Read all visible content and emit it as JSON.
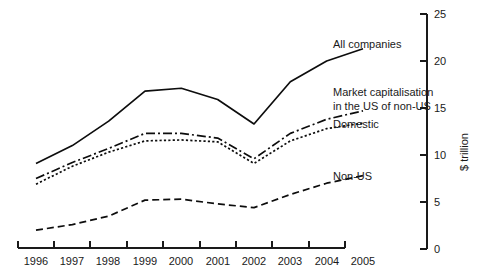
{
  "chart_data": {
    "type": "line",
    "title": "",
    "xlabel": "",
    "ylabel": "$ trillion",
    "ylim": [
      0,
      25
    ],
    "yticks": [
      0,
      5,
      10,
      15,
      20,
      25
    ],
    "grid": false,
    "legend_position": "right-inline-labels",
    "categories": [
      "1996",
      "1997",
      "1998",
      "1999",
      "2000",
      "2001",
      "2002",
      "2003",
      "2004",
      "2005"
    ],
    "x": [
      1996,
      1997,
      1998,
      1999,
      2000,
      2001,
      2002,
      2003,
      2004,
      2005
    ],
    "series": [
      {
        "name": "All companies",
        "style": "solid",
        "values": [
          9.1,
          11.0,
          13.6,
          16.8,
          17.1,
          15.9,
          13.3,
          17.8,
          20.0,
          21.3
        ]
      },
      {
        "name": "Market capitalisation in the US of non-US",
        "label_line1": "Market capitalisation",
        "label_line2": "in the US of non-US",
        "style": "dash-dot",
        "values": [
          7.5,
          9.2,
          10.7,
          12.3,
          12.3,
          11.8,
          9.6,
          12.3,
          13.8,
          14.7
        ]
      },
      {
        "name": "Domestic",
        "style": "dotted",
        "values": [
          6.9,
          8.8,
          10.3,
          11.5,
          11.6,
          11.4,
          9.1,
          11.5,
          12.8,
          13.4
        ]
      },
      {
        "name": "Non-US",
        "style": "dashed",
        "values": [
          2.0,
          2.6,
          3.5,
          5.2,
          5.3,
          4.8,
          4.4,
          5.8,
          7.0,
          7.8
        ]
      }
    ]
  },
  "axes": {
    "y_tick_labels": [
      "25",
      "20",
      "15",
      "10",
      "5",
      "0"
    ],
    "y_axis_title": "$ trillion",
    "x_tick_labels": [
      "1996",
      "1997",
      "1998",
      "1999",
      "2000",
      "2001",
      "2002",
      "2003",
      "2004",
      "2005"
    ]
  },
  "labels": {
    "all_companies": "All companies",
    "market_cap_line1": "Market capitalisation",
    "market_cap_line2": "in the US of non-US",
    "domestic": "Domestic",
    "non_us": "Non-US"
  },
  "colors": {
    "ink": "#0d0d0d",
    "background": "#ffffff"
  }
}
